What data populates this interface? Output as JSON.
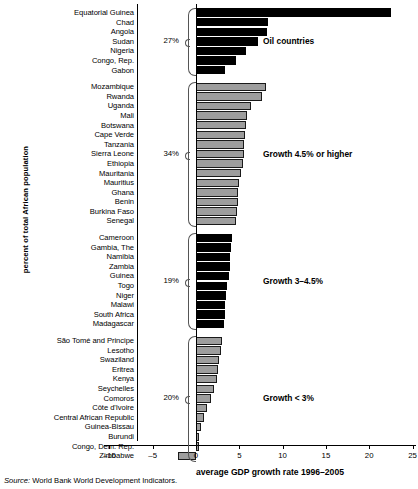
{
  "chart_data": {
    "type": "bar",
    "orientation": "horizontal",
    "title": "",
    "xlabel": "average GDP growth rate 1996–2005",
    "ylabel": "percent of total African population",
    "xlim": [
      -10,
      25
    ],
    "xticks": [
      -10,
      -5,
      0,
      5,
      10,
      15,
      20,
      25
    ],
    "xticklabels": [
      "–10",
      "–5",
      "0",
      "5",
      "10",
      "15",
      "20",
      "25"
    ],
    "grid": false,
    "legend": "none",
    "source": "Source: World Bank World Development Indicators.",
    "source_prefix": "Source:",
    "source_text": "World Bank World Development Indicators.",
    "groups": [
      {
        "id": "oil",
        "annotation": "Oil countries",
        "percent": "27%",
        "color": "#000000",
        "categories": [
          "Equatorial Guinea",
          "Chad",
          "Angola",
          "Sudan",
          "Nigeria",
          "Congo, Rep.",
          "Gabon"
        ],
        "values": [
          22.5,
          8.3,
          8.2,
          7.2,
          5.8,
          4.6,
          3.3
        ]
      },
      {
        "id": "growth45",
        "annotation": "Growth 4.5% or higher",
        "percent": "34%",
        "color": "#9d9d9d",
        "categories": [
          "Mozambique",
          "Rwanda",
          "Uganda",
          "Mali",
          "Botswana",
          "Cape Verde",
          "Tanzania",
          "Sierra Leone",
          "Ethiopia",
          "Mauritania",
          "Mauritius",
          "Ghana",
          "Benin",
          "Burkina Faso",
          "Senegal"
        ],
        "values": [
          8.1,
          7.6,
          6.3,
          5.9,
          5.8,
          5.7,
          5.6,
          5.5,
          5.4,
          5.2,
          5.0,
          4.9,
          4.8,
          4.7,
          4.6
        ]
      },
      {
        "id": "growth3to45",
        "annotation": "Growth 3–4.5%",
        "percent": "19%",
        "color": "#000000",
        "categories": [
          "Cameroon",
          "Gambia, The",
          "Namibia",
          "Zambia",
          "Guinea",
          "Togo",
          "Niger",
          "Malawi",
          "South Africa",
          "Madagascar"
        ],
        "values": [
          4.1,
          4.0,
          3.9,
          3.9,
          3.8,
          3.6,
          3.5,
          3.4,
          3.3,
          3.2
        ]
      },
      {
        "id": "growthlt3",
        "annotation": "Growth < 3%",
        "percent": "20%",
        "color": "#9d9d9d",
        "categories": [
          "São Tomé and Principe",
          "Lesotho",
          "Swaziland",
          "Eritrea",
          "Kenya",
          "Seychelles",
          "Comoros",
          "Côte d'Ivoire",
          "Central African Republic",
          "Guinea-Bissau",
          "Burundi",
          "Congo, Dem. Rep.",
          "Zimbabwe"
        ],
        "values": [
          3.0,
          2.9,
          2.7,
          2.5,
          2.4,
          2.1,
          1.7,
          1.3,
          0.9,
          0.6,
          0.4,
          0.3,
          -2.1
        ]
      }
    ]
  }
}
